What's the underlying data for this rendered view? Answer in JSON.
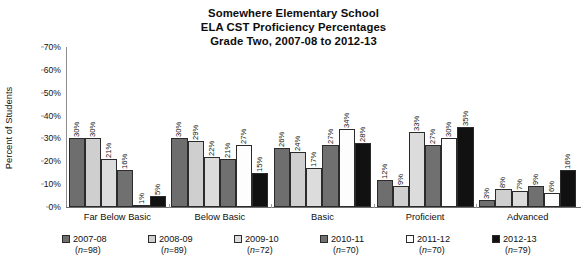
{
  "chart_data": {
    "type": "bar",
    "title": "Somewhere Elementary School ELA CST Proficiency Percentages Grade Two, 2007-08 to 2012-13",
    "title_lines": [
      "Somewhere Elementary School",
      "ELA CST Proficiency Percentages",
      "Grade Two, 2007-08 to 2012-13"
    ],
    "xlabel": "",
    "ylabel": "Percent of Students",
    "ylim": [
      0,
      70
    ],
    "ytick_labels": [
      "0%",
      "10%",
      "20%",
      "30%",
      "40%",
      "50%",
      "60%",
      "70%"
    ],
    "ytick_values": [
      0,
      10,
      20,
      30,
      40,
      50,
      60,
      70
    ],
    "grid": false,
    "legend_position": "bottom",
    "categories": [
      "Far Below Basic",
      "Below Basic",
      "Basic",
      "Proficient",
      "Advanced"
    ],
    "series": [
      {
        "name": "2007-08",
        "n": "(n=98)",
        "color": "#6e6e6e",
        "values": [
          30,
          30,
          26,
          12,
          3
        ],
        "labels": [
          "30%",
          "30%",
          "26%",
          "12%",
          "3%"
        ]
      },
      {
        "name": "2008-09",
        "n": "(n=89)",
        "color": "#cfcfcf",
        "values": [
          30,
          29,
          24,
          9,
          8
        ],
        "labels": [
          "30%",
          "29%",
          "24%",
          "9%",
          "8%"
        ]
      },
      {
        "name": "2009-10",
        "n": "(n=72)",
        "color": "#dcdcdc",
        "values": [
          21,
          22,
          17,
          33,
          7
        ],
        "labels": [
          "21%",
          "22%",
          "17%",
          "33%",
          "7%"
        ]
      },
      {
        "name": "2010-11",
        "n": "(n=70)",
        "color": "#707070",
        "values": [
          16,
          21,
          27,
          27,
          9
        ],
        "labels": [
          "16%",
          "21%",
          "27%",
          "27%",
          "9%"
        ]
      },
      {
        "name": "2011-12",
        "n": "(n=70)",
        "color": "#fdfdfd",
        "values": [
          1,
          27,
          34,
          30,
          6
        ],
        "labels": [
          "1%",
          "27%",
          "34%",
          "30%",
          "6%"
        ]
      },
      {
        "name": "2012-13",
        "n": "(n=79)",
        "color": "#111111",
        "values": [
          5,
          15,
          28,
          35,
          16
        ],
        "labels": [
          "5%",
          "15%",
          "28%",
          "35%",
          "16%"
        ]
      }
    ]
  }
}
